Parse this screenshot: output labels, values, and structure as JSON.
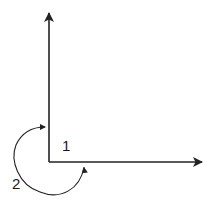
{
  "diagram": {
    "type": "coordinate-axes-with-angle-arcs",
    "stroke_color": "#222222",
    "labels": [
      {
        "id": "angle-1",
        "text": "1",
        "x": 62,
        "y": 138
      },
      {
        "id": "angle-2",
        "text": "2",
        "x": 12,
        "y": 176
      }
    ],
    "axes": {
      "origin": [
        49,
        162
      ],
      "vertical_tip": [
        49,
        12
      ],
      "horizontal_tip": [
        203,
        162
      ]
    }
  }
}
